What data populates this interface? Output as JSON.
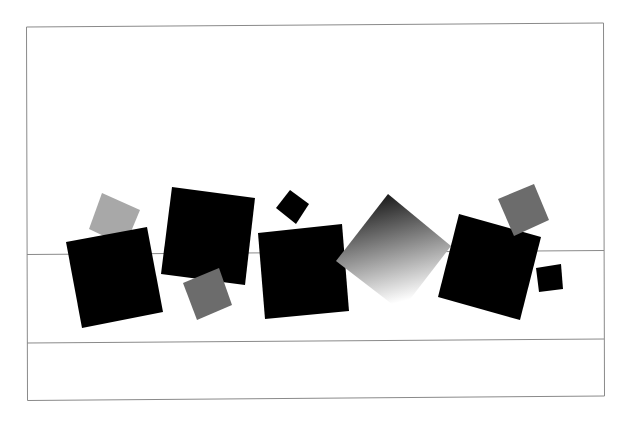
{
  "composition": {
    "title": "Rotated squares composition",
    "colors": {
      "background": "#ffffff",
      "frame": "#8a8a8a",
      "black": "#000000",
      "light_gray": "#a8a8a8",
      "mid_gray": "#6c6c6c",
      "gradient_start": "#000000",
      "gradient_end": "#ffffff"
    },
    "shapes": [
      {
        "name": "light-gray-square-1",
        "fill": "light_gray"
      },
      {
        "name": "black-square-1",
        "fill": "black"
      },
      {
        "name": "black-square-2",
        "fill": "black"
      },
      {
        "name": "mid-gray-square-1",
        "fill": "mid_gray"
      },
      {
        "name": "small-black-square-1",
        "fill": "black"
      },
      {
        "name": "black-square-3",
        "fill": "black"
      },
      {
        "name": "gradient-square",
        "fill": "gradient"
      },
      {
        "name": "black-square-4",
        "fill": "black"
      },
      {
        "name": "mid-gray-square-2",
        "fill": "mid_gray"
      },
      {
        "name": "small-black-square-2",
        "fill": "black"
      }
    ]
  }
}
